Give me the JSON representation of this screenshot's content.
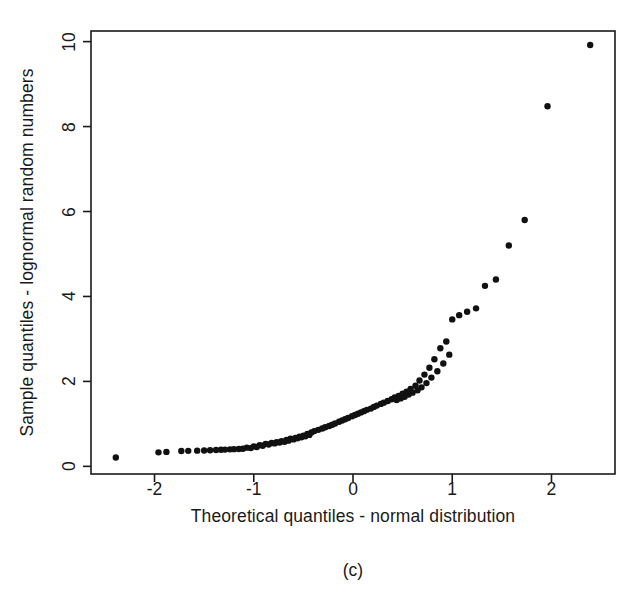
{
  "figure": {
    "caption": "(c)",
    "background_color": "#ffffff",
    "foreground_color": "#1a1a1a",
    "point_color": "#111111"
  },
  "chart_data": {
    "type": "scatter",
    "title": "",
    "subtitle": "",
    "caption": "(c)",
    "xlabel": "Theoretical quantiles - normal distribution",
    "ylabel": "Sample quantiles - lognormal random numbers",
    "xlim": [
      -2.64,
      2.64
    ],
    "ylim": [
      -0.18,
      10.25
    ],
    "xticks": [
      -2,
      -1,
      0,
      1,
      2
    ],
    "xticklabels": [
      "-2",
      "-1",
      "0",
      "1",
      "2"
    ],
    "yticks": [
      0,
      2,
      4,
      6,
      8,
      10
    ],
    "yticklabels": [
      "0",
      "2",
      "4",
      "6",
      "8",
      "10"
    ],
    "grid": false,
    "legend": null,
    "legend_position": "none",
    "frame": "box",
    "marker": "filled-circle",
    "marker_size_px": 5,
    "n_points": 100,
    "series": [
      {
        "name": "lognormal sample quantiles",
        "x": [
          -2.39,
          -1.96,
          -1.73,
          -1.57,
          -1.44,
          -1.33,
          -1.24,
          -1.15,
          -1.07,
          -1.0,
          -0.94,
          -0.88,
          -0.82,
          -0.77,
          -0.72,
          -0.67,
          -0.63,
          -0.58,
          -0.54,
          -0.5,
          -0.46,
          -0.42,
          -0.39,
          -0.35,
          -0.31,
          -0.28,
          -0.24,
          -0.21,
          -0.18,
          -0.14,
          -0.11,
          -0.08,
          -0.05,
          -0.01,
          0.02,
          0.05,
          0.08,
          0.11,
          0.14,
          0.18,
          0.21,
          0.24,
          0.28,
          0.31,
          0.35,
          0.39,
          0.42,
          0.46,
          0.5,
          0.54,
          0.58,
          0.63,
          0.67,
          0.72,
          0.77,
          0.82,
          0.88,
          0.94,
          1.0,
          1.07,
          1.15,
          1.24,
          1.33,
          1.44,
          1.57,
          1.73,
          1.96,
          2.39,
          -1.88,
          -1.66,
          -1.5,
          -1.38,
          -1.29,
          -1.2,
          -1.11,
          -1.03,
          -0.97,
          -0.91,
          -0.85,
          -0.79,
          -0.74,
          -0.69,
          -0.65,
          -0.6,
          -0.56,
          -0.52,
          -0.48,
          -0.44,
          0.44,
          0.48,
          0.52,
          0.56,
          0.6,
          0.65,
          0.69,
          0.74,
          0.79,
          0.85,
          0.91,
          0.97
        ],
        "y": [
          0.21,
          0.33,
          0.36,
          0.37,
          0.38,
          0.39,
          0.4,
          0.41,
          0.44,
          0.47,
          0.5,
          0.53,
          0.55,
          0.57,
          0.59,
          0.62,
          0.65,
          0.67,
          0.7,
          0.72,
          0.76,
          0.8,
          0.83,
          0.86,
          0.89,
          0.92,
          0.95,
          0.98,
          1.01,
          1.05,
          1.08,
          1.11,
          1.14,
          1.18,
          1.21,
          1.24,
          1.27,
          1.3,
          1.33,
          1.36,
          1.4,
          1.43,
          1.47,
          1.5,
          1.54,
          1.58,
          1.62,
          1.66,
          1.71,
          1.76,
          1.82,
          1.9,
          2.02,
          2.16,
          2.32,
          2.52,
          2.78,
          2.94,
          3.46,
          3.56,
          3.64,
          3.72,
          4.25,
          4.4,
          5.2,
          5.8,
          8.48,
          9.92,
          0.34,
          0.365,
          0.375,
          0.385,
          0.395,
          0.405,
          0.415,
          0.43,
          0.455,
          0.485,
          0.515,
          0.54,
          0.56,
          0.58,
          0.605,
          0.635,
          0.66,
          0.685,
          0.71,
          0.74,
          1.56,
          1.6,
          1.64,
          1.69,
          1.735,
          1.79,
          1.86,
          1.96,
          2.09,
          2.24,
          2.42,
          2.63
        ]
      }
    ]
  },
  "axes": {
    "x_title": "Theoretical quantiles - normal distribution",
    "y_title": "Sample quantiles - lognormal random numbers",
    "x_tick_labels": [
      "-2",
      "-1",
      "0",
      "1",
      "2"
    ],
    "y_tick_labels": [
      "0",
      "2",
      "4",
      "6",
      "8",
      "10"
    ]
  }
}
